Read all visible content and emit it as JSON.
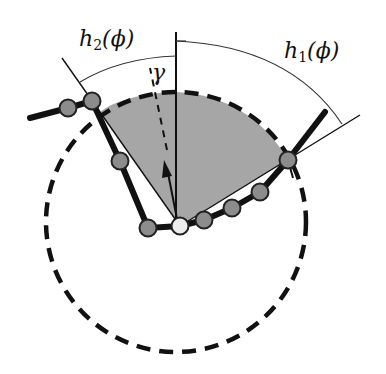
{
  "diagram": {
    "labels": {
      "h2": {
        "base": "h",
        "sub": "2",
        "arg": "(ϕ)"
      },
      "h1": {
        "base": "h",
        "sub": "1",
        "arg": "(ϕ)"
      },
      "gamma": "γ"
    },
    "colors": {
      "sector_fill": "#a6a6a6",
      "node_fill": "#8c8c8c",
      "center_node_fill": "#ececec",
      "stroke": "#111111"
    },
    "nodes": [
      {
        "x": 68,
        "y": 108,
        "type": "chain"
      },
      {
        "x": 92,
        "y": 101,
        "type": "chain"
      },
      {
        "x": 120,
        "y": 161,
        "type": "chain"
      },
      {
        "x": 148,
        "y": 228,
        "type": "chain"
      },
      {
        "x": 180,
        "y": 226,
        "type": "center"
      },
      {
        "x": 204,
        "y": 220,
        "type": "chain"
      },
      {
        "x": 232,
        "y": 208,
        "type": "chain"
      },
      {
        "x": 260,
        "y": 192,
        "type": "chain"
      },
      {
        "x": 288,
        "y": 160,
        "type": "chain"
      }
    ]
  }
}
